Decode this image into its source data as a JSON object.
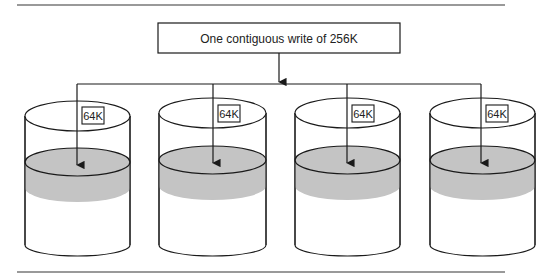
{
  "diagram": {
    "title_box": {
      "label": "One contiguous write of 256K"
    },
    "disks": [
      {
        "label": "64K"
      },
      {
        "label": "64K"
      },
      {
        "label": "64K"
      },
      {
        "label": "64K"
      }
    ],
    "colors": {
      "line": "#1a1a1a",
      "shade": "#c4c4c4",
      "rule": "#777777"
    }
  }
}
